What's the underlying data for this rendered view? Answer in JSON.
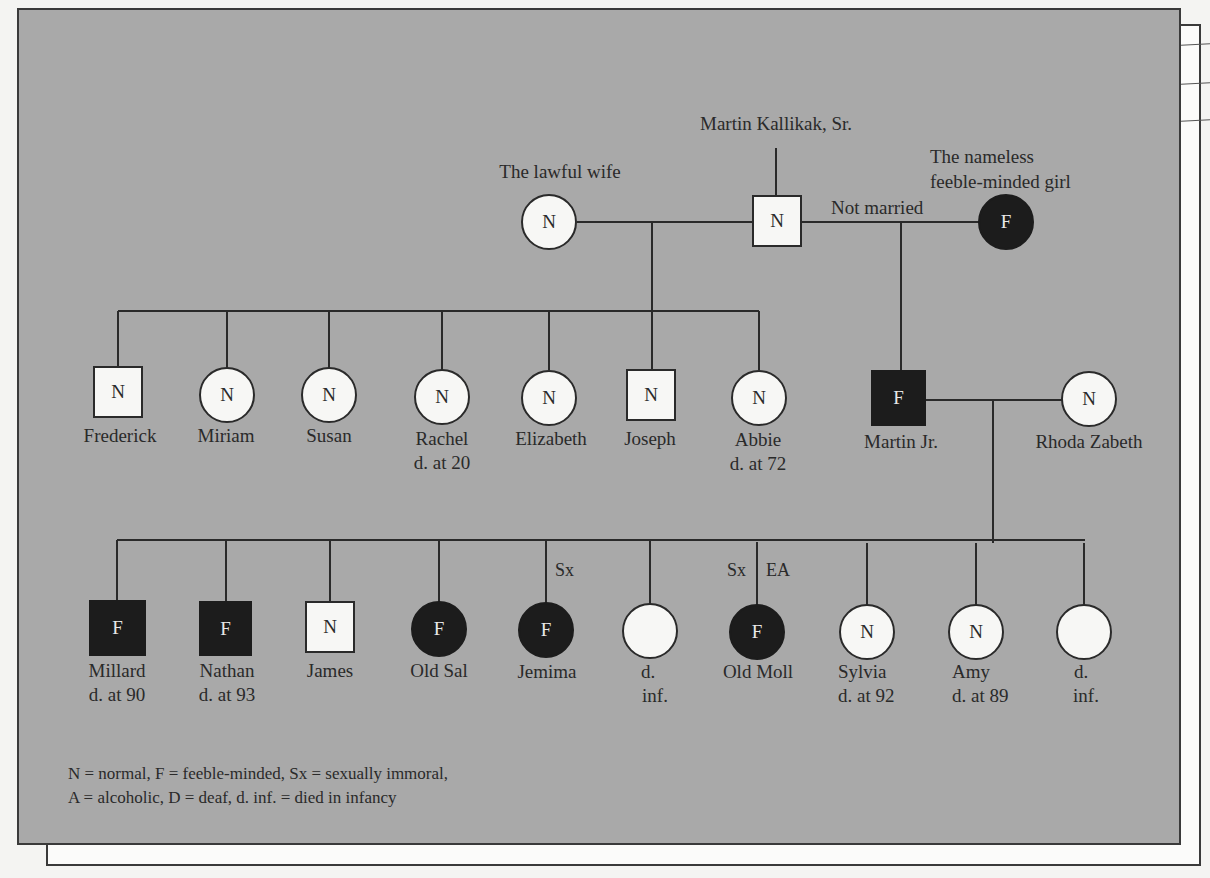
{
  "diagram": {
    "type": "pedigree",
    "colors": {
      "panel_background": "#a9a9a9",
      "page_background": "#f4f4f2",
      "normal_fill": "#f7f7f5",
      "feeble_minded_fill": "#1c1c1c",
      "line": "#2a2a2a"
    },
    "generation1": {
      "patriarch": {
        "name": "Martin Kallikak, Sr.",
        "shape": "square",
        "status": "N"
      },
      "lawful_wife": {
        "name": "The lawful wife",
        "shape": "circle",
        "status": "N"
      },
      "nameless_girl": {
        "name_line1": "The nameless",
        "name_line2": "feeble-minded girl",
        "shape": "circle",
        "status": "F"
      },
      "relationship_label": "Not married"
    },
    "generation2_lawful": [
      {
        "name": "Frederick",
        "shape": "square",
        "status": "N",
        "note": ""
      },
      {
        "name": "Miriam",
        "shape": "circle",
        "status": "N",
        "note": ""
      },
      {
        "name": "Susan",
        "shape": "circle",
        "status": "N",
        "note": ""
      },
      {
        "name": "Rachel",
        "shape": "circle",
        "status": "N",
        "note": "d. at 20"
      },
      {
        "name": "Elizabeth",
        "shape": "circle",
        "status": "N",
        "note": ""
      },
      {
        "name": "Joseph",
        "shape": "square",
        "status": "N",
        "note": ""
      },
      {
        "name": "Abbie",
        "shape": "circle",
        "status": "N",
        "note": "d. at 72"
      }
    ],
    "generation2_illegitimate": {
      "son": {
        "name": "Martin Jr.",
        "shape": "square",
        "status": "F"
      },
      "spouse": {
        "name": "Rhoda Zabeth",
        "shape": "circle",
        "status": "N"
      }
    },
    "generation3": [
      {
        "name": "Millard",
        "shape": "square",
        "status": "F",
        "note": "d. at 90",
        "traits_left": "",
        "traits_right": ""
      },
      {
        "name": "Nathan",
        "shape": "square",
        "status": "F",
        "note": "d. at 93",
        "traits_left": "",
        "traits_right": ""
      },
      {
        "name": "James",
        "shape": "square",
        "status": "N",
        "note": "",
        "traits_left": "",
        "traits_right": ""
      },
      {
        "name": "Old Sal",
        "shape": "circle",
        "status": "F",
        "note": "",
        "traits_left": "",
        "traits_right": ""
      },
      {
        "name": "Jemima",
        "shape": "circle",
        "status": "F",
        "note": "",
        "traits_left": "",
        "traits_right": "Sx"
      },
      {
        "name": "d.",
        "shape": "circle",
        "status": "",
        "note": "inf.",
        "traits_left": "",
        "traits_right": ""
      },
      {
        "name": "Old Moll",
        "shape": "circle",
        "status": "F",
        "note": "",
        "traits_left": "Sx",
        "traits_right": "EA"
      },
      {
        "name": "Sylvia",
        "shape": "circle",
        "status": "N",
        "note": "d. at 92",
        "traits_left": "",
        "traits_right": ""
      },
      {
        "name": "Amy",
        "shape": "circle",
        "status": "N",
        "note": "d. at 89",
        "traits_left": "",
        "traits_right": ""
      },
      {
        "name": "d.",
        "shape": "circle",
        "status": "",
        "note": "inf.",
        "traits_left": "",
        "traits_right": ""
      }
    ],
    "legend": {
      "line1": "N = normal, F = feeble-minded, Sx = sexually immoral,",
      "line2": "A = alcoholic, D = deaf, d. inf. = died in infancy"
    }
  }
}
